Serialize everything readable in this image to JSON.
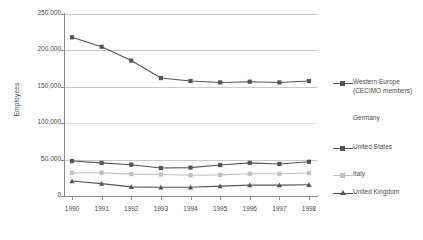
{
  "chart_data": {
    "type": "line",
    "title": "",
    "xlabel": "",
    "ylabel": "Employees",
    "categories": [
      "1990",
      "1991",
      "1992",
      "1993",
      "1994",
      "1995",
      "1996",
      "1997",
      "1998"
    ],
    "x": [
      1990,
      1991,
      1992,
      1993,
      1994,
      1995,
      1996,
      1997,
      1998
    ],
    "ylim": [
      0,
      250000
    ],
    "ytick_labels": [
      "250,000",
      "200,000",
      "150,000",
      "100,000",
      "50,000",
      "0"
    ],
    "ytick_values": [
      250000,
      200000,
      150000,
      100000,
      50000,
      0
    ],
    "grid": true,
    "legend_position": "right",
    "series": [
      {
        "name": "Western Europe\n(CECIMO members)",
        "legend_label": "Western Europe\n(CECIMO members)",
        "color": "#555555",
        "marker": "square",
        "values": [
          218000,
          205000,
          186000,
          162000,
          158000,
          156000,
          157000,
          156000,
          158000
        ]
      },
      {
        "name": "Germany",
        "legend_label": "Germany",
        "color": "#e3e3e3",
        "marker": "none",
        "values": [
          null,
          null,
          null,
          null,
          null,
          null,
          null,
          null,
          null
        ]
      },
      {
        "name": "United States",
        "legend_label": "United States",
        "color": "#555555",
        "marker": "square",
        "values": [
          48000,
          45500,
          43000,
          38500,
          39000,
          42500,
          45500,
          44000,
          47000
        ]
      },
      {
        "name": "Italy",
        "legend_label": "Italy",
        "color": "#c0c0c0",
        "marker": "square",
        "values": [
          32000,
          32000,
          30000,
          29500,
          28500,
          29000,
          30500,
          30500,
          31500
        ]
      },
      {
        "name": "United Kingdom",
        "legend_label": "United Kingdom",
        "color": "#555555",
        "marker": "triangle",
        "values": [
          20500,
          17000,
          12500,
          12000,
          12000,
          13500,
          15000,
          15000,
          15500
        ]
      }
    ]
  },
  "legend": {
    "items": [
      {
        "label": "Western Europe\n(CECIMO members)",
        "color": "#555555",
        "marker": "square"
      },
      {
        "label": "Germany",
        "color": "#e3e3e3",
        "marker": "none"
      },
      {
        "label": "United States",
        "color": "#555555",
        "marker": "square"
      },
      {
        "label": "Italy",
        "color": "#c0c0c0",
        "marker": "square"
      },
      {
        "label": "United Kingdom",
        "color": "#555555",
        "marker": "triangle"
      }
    ]
  },
  "colors": {
    "axis": "#8a8a8a",
    "grid": "#c9c9c9",
    "text": "#4a4a4a",
    "dark_series": "#555555",
    "light_series": "#c0c0c0",
    "faint_series": "#e3e3e3",
    "background": "#ffffff"
  }
}
